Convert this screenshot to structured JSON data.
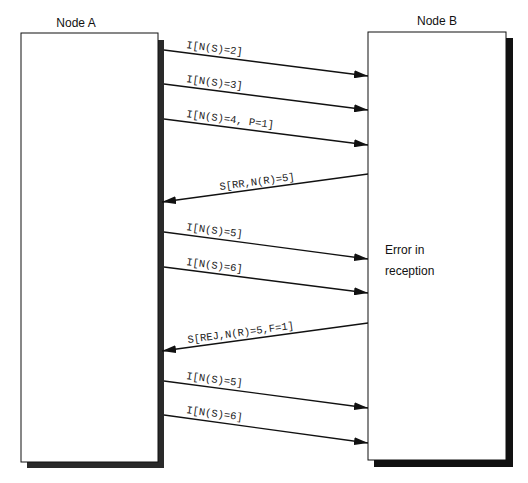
{
  "nodes": {
    "a": {
      "label": "Node A",
      "box": [
        21,
        33,
        158,
        462
      ]
    },
    "b": {
      "label": "Node B",
      "box": [
        368,
        32,
        506,
        460
      ]
    }
  },
  "note": {
    "lines": [
      "Error in",
      "reception"
    ]
  },
  "messages": [
    {
      "label": "I[N(S)=2]",
      "direction": "A->B",
      "y_start": 50,
      "y_end": 76
    },
    {
      "label": "I[N(S)=3]",
      "direction": "A->B",
      "y_start": 84,
      "y_end": 110
    },
    {
      "label": "I[N(S)=4, P=1]",
      "direction": "A->B",
      "y_start": 119,
      "y_end": 145
    },
    {
      "label": "S[RR,N(R)=5]",
      "direction": "B->A",
      "y_start": 174,
      "y_end": 202
    },
    {
      "label": "I[N(S)=5]",
      "direction": "A->B",
      "y_start": 232,
      "y_end": 259
    },
    {
      "label": "I[N(S)=6]",
      "direction": "A->B",
      "y_start": 267,
      "y_end": 293
    },
    {
      "label": "S[REJ,N(R)=5,F=1]",
      "direction": "B->A",
      "y_start": 323,
      "y_end": 351
    },
    {
      "label": "I[N(S)=5]",
      "direction": "A->B",
      "y_start": 381,
      "y_end": 408
    },
    {
      "label": "I[N(S)=6]",
      "direction": "A->B",
      "y_start": 415,
      "y_end": 443
    }
  ],
  "colors": {
    "line": "#111111",
    "shadow": "#2a2a2a",
    "box_fill": "#ffffff"
  }
}
